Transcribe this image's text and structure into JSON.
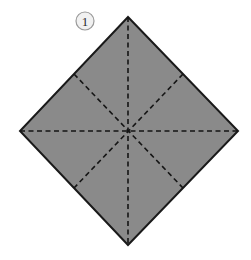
{
  "figure": {
    "background_color": "#ffffff",
    "step_badge": {
      "label": "1",
      "circle_fill": "#f1f1f1",
      "circle_stroke": "#9a9a9a",
      "text_color": "#2b2b2b",
      "cx": 85,
      "cy": 21,
      "r": 9
    },
    "shape": {
      "name": "square-rotated-45",
      "fill_color": "#8a8a8a",
      "stroke_color": "#1a1a1a",
      "stroke_width": 2,
      "vertices": [
        {
          "name": "top",
          "x": 128,
          "y": 17
        },
        {
          "name": "right",
          "x": 238,
          "y": 131
        },
        {
          "name": "bottom",
          "x": 128,
          "y": 245
        },
        {
          "name": "left",
          "x": 20,
          "y": 131
        }
      ],
      "edge_midpoints": [
        {
          "name": "top-right-mid",
          "x": 183,
          "y": 74
        },
        {
          "name": "bottom-right-mid",
          "x": 183,
          "y": 188
        },
        {
          "name": "bottom-left-mid",
          "x": 74,
          "y": 188
        },
        {
          "name": "top-left-mid",
          "x": 74,
          "y": 74
        }
      ],
      "center": {
        "x": 128,
        "y": 131
      }
    },
    "fold_lines": {
      "style": "dashed",
      "color": "#151515",
      "stroke_width": 1.6,
      "dash_pattern": "5 3.5",
      "lines": [
        {
          "name": "vertical-fold",
          "x1": 128,
          "y1": 17,
          "x2": 128,
          "y2": 245
        },
        {
          "name": "horizontal-fold",
          "x1": 20,
          "y1": 131,
          "x2": 238,
          "y2": 131
        },
        {
          "name": "diagonal-fold-nw-se",
          "x1": 74,
          "y1": 74,
          "x2": 183,
          "y2": 188
        },
        {
          "name": "diagonal-fold-ne-sw",
          "x1": 183,
          "y1": 74,
          "x2": 74,
          "y2": 188
        }
      ]
    }
  }
}
